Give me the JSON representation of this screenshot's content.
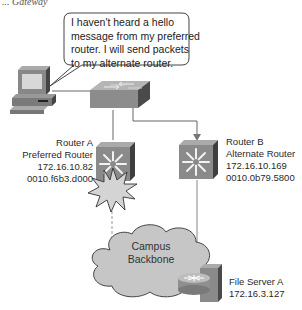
{
  "figure": {
    "caption_fragment": "... Gateway",
    "speech_bubble": {
      "lines": [
        "I haven't heard a hello",
        "message from my preferred",
        "router. I will send packets",
        "to my alternate router."
      ]
    },
    "router_a": {
      "name": "Router A",
      "role": "Preferred Router",
      "ip": "172.16.10.82",
      "mac": "0010.f6b3.d000",
      "status": "failed"
    },
    "router_b": {
      "name": "Router B",
      "role": "Alternate Router",
      "ip": "172.16.10.169",
      "mac": "0010.0b79.5800",
      "status": "active"
    },
    "cloud": {
      "lines": [
        "Campus",
        "Backbone"
      ]
    },
    "file_server": {
      "name": "File Server A",
      "ip": "172.16.3.127"
    },
    "colors": {
      "device_gray": "#8c8c8c",
      "device_dark": "#555555",
      "cloud_fill": "#c8c8c8",
      "explosion_fill": "#d6d6d6",
      "line": "#666666",
      "dashed_line": "#999999"
    }
  }
}
